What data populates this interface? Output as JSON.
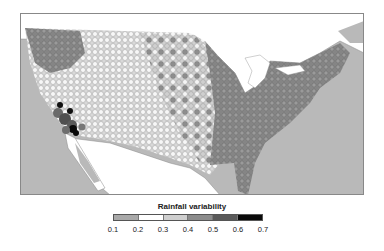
{
  "map": {
    "subject": "Contiguous United States station-level rainfall variability",
    "ocean_color": "#b9b9b9",
    "foreign_land_color": "#ffffff",
    "regions": [
      {
        "name": "east",
        "dominant_class": "0.4-0.5",
        "color": "#8a8a8a"
      },
      {
        "name": "west-interior",
        "dominant_class": "0.2-0.3",
        "color": "#f2f2f2"
      },
      {
        "name": "pacific-northwest",
        "dominant_class": "0.4-0.5",
        "color": "#8f8f8f"
      },
      {
        "name": "southern-california",
        "dominant_class": "0.6-0.7",
        "color": "#111111"
      }
    ]
  },
  "legend": {
    "title": "Rainfall variability",
    "bins": [
      {
        "from": 0.1,
        "to": 0.2,
        "color": "#a9a9a9"
      },
      {
        "from": 0.2,
        "to": 0.3,
        "color": "#ffffff"
      },
      {
        "from": 0.3,
        "to": 0.4,
        "color": "#cfcfcf"
      },
      {
        "from": 0.4,
        "to": 0.5,
        "color": "#8c8c8c"
      },
      {
        "from": 0.5,
        "to": 0.6,
        "color": "#5a5a5a"
      },
      {
        "from": 0.6,
        "to": 0.7,
        "color": "#0a0a0a"
      }
    ],
    "ticks": [
      "0.1",
      "0.2",
      "0.3",
      "0.4",
      "0.5",
      "0.6",
      "0.7"
    ]
  }
}
